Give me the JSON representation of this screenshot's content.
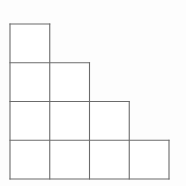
{
  "figure": {
    "name": "staircase-grid-figure",
    "background_color": "#fdfdfd",
    "line_color": "#6b6b6b",
    "fill_color": "#ffffff",
    "line_width": 1.1,
    "cell_width": 39.75,
    "cell_height": 38.75,
    "origin_x": 10,
    "origin_y": 24,
    "columns": 4,
    "rows": 4,
    "x_grid": [
      10,
      49.75,
      89.5,
      129.25,
      169
    ],
    "y_grid": [
      24,
      62.75,
      101.5,
      140.25,
      179
    ],
    "row_square_counts": [
      1,
      2,
      3,
      4
    ],
    "total_squares": 10
  },
  "chart_data": {
    "type": "table",
    "title": "",
    "categories": [
      "Row 1",
      "Row 2",
      "Row 3",
      "Row 4"
    ],
    "values": [
      1,
      2,
      3,
      4
    ],
    "xlabel": "",
    "ylabel": "",
    "annotations": []
  },
  "cells": [
    {
      "id": "cell-r1-c1",
      "row": 1,
      "col": 1,
      "x": 10,
      "y": 24,
      "w": 39.75,
      "h": 38.75
    },
    {
      "id": "cell-r2-c1",
      "row": 2,
      "col": 1,
      "x": 10,
      "y": 62.75,
      "w": 39.75,
      "h": 38.75
    },
    {
      "id": "cell-r2-c2",
      "row": 2,
      "col": 2,
      "x": 49.75,
      "y": 62.75,
      "w": 39.75,
      "h": 38.75
    },
    {
      "id": "cell-r3-c1",
      "row": 3,
      "col": 1,
      "x": 10,
      "y": 101.5,
      "w": 39.75,
      "h": 38.75
    },
    {
      "id": "cell-r3-c2",
      "row": 3,
      "col": 2,
      "x": 49.75,
      "y": 101.5,
      "w": 39.75,
      "h": 38.75
    },
    {
      "id": "cell-r3-c3",
      "row": 3,
      "col": 3,
      "x": 89.5,
      "y": 101.5,
      "w": 39.75,
      "h": 38.75
    },
    {
      "id": "cell-r4-c1",
      "row": 4,
      "col": 1,
      "x": 10,
      "y": 140.25,
      "w": 39.75,
      "h": 38.75
    },
    {
      "id": "cell-r4-c2",
      "row": 4,
      "col": 2,
      "x": 49.75,
      "y": 140.25,
      "w": 39.75,
      "h": 38.75
    },
    {
      "id": "cell-r4-c3",
      "row": 4,
      "col": 3,
      "x": 89.5,
      "y": 140.25,
      "w": 39.75,
      "h": 38.75
    },
    {
      "id": "cell-r4-c4",
      "row": 4,
      "col": 4,
      "x": 129.25,
      "y": 140.25,
      "w": 39.75,
      "h": 38.75
    }
  ],
  "segments": [
    {
      "id": "h-row1-top",
      "x1": 10,
      "y1": 24,
      "x2": 49.75,
      "y2": 24
    },
    {
      "id": "h-row2-top",
      "x1": 10,
      "y1": 62.75,
      "x2": 89.5,
      "y2": 62.75
    },
    {
      "id": "h-row3-top",
      "x1": 10,
      "y1": 101.5,
      "x2": 129.25,
      "y2": 101.5
    },
    {
      "id": "h-row4-top",
      "x1": 10,
      "y1": 140.25,
      "x2": 169,
      "y2": 140.25
    },
    {
      "id": "h-bottom",
      "x1": 10,
      "y1": 179,
      "x2": 169,
      "y2": 179
    },
    {
      "id": "v-col0-left",
      "x1": 10,
      "y1": 24,
      "x2": 10,
      "y2": 179
    },
    {
      "id": "v-col1",
      "x1": 49.75,
      "y1": 24,
      "x2": 49.75,
      "y2": 179
    },
    {
      "id": "v-col2",
      "x1": 89.5,
      "y1": 62.75,
      "x2": 89.5,
      "y2": 179
    },
    {
      "id": "v-col3",
      "x1": 129.25,
      "y1": 101.5,
      "x2": 129.25,
      "y2": 179
    },
    {
      "id": "v-col4-right",
      "x1": 169,
      "y1": 140.25,
      "x2": 169,
      "y2": 179
    }
  ]
}
